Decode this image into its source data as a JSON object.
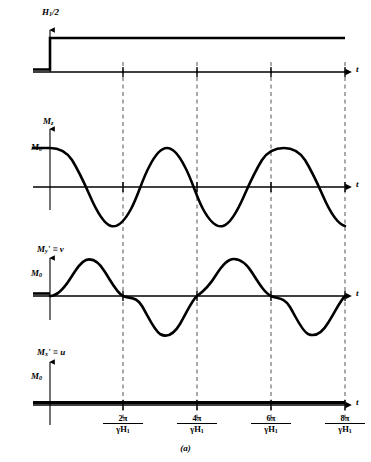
{
  "figure": {
    "caption": "(a)",
    "panels": [
      {
        "id": "h1-panel",
        "y_label_html": "H<sub>1</sub>/2",
        "y_label_text": "H1/2",
        "amplitude_label": "",
        "x_axis_label": "t",
        "curve": "step"
      },
      {
        "id": "mz-panel",
        "y_label_html": "M<sub>z</sub>",
        "y_label_text": "Mz",
        "amplitude_label": "M0",
        "amplitude_label_html": "M<sub>0</sub>",
        "x_axis_label": "t",
        "curve": "cosine"
      },
      {
        "id": "my-panel",
        "y_label_html": "M<sub>y</sub>' ≡ v",
        "y_label_text": "My' = v",
        "amplitude_label": "M0",
        "amplitude_label_html": "M<sub>0</sub>",
        "x_axis_label": "t",
        "curve": "sine"
      },
      {
        "id": "mx-panel",
        "y_label_html": "M<sub>x</sub>' ≡ u",
        "y_label_text": "Mx' = u",
        "amplitude_label": "M0",
        "amplitude_label_html": "M<sub>0</sub>",
        "x_axis_label": "t",
        "curve": "zero"
      }
    ],
    "x_ticks": [
      {
        "numerator": "2π",
        "denominator": "γH1",
        "denominator_html": "γH<sub>1</sub>"
      },
      {
        "numerator": "4π",
        "denominator": "γH1",
        "denominator_html": "γH<sub>1</sub>"
      },
      {
        "numerator": "6π",
        "denominator": "γH1",
        "denominator_html": "γH<sub>1</sub>"
      },
      {
        "numerator": "8π",
        "denominator": "γH1",
        "denominator_html": "γH<sub>1</sub>"
      }
    ],
    "colors": {
      "curve": "#000000",
      "axis": "#000000",
      "gridline": "#555555",
      "background": "#ffffff"
    }
  },
  "chart_data": {
    "type": "line",
    "title": "(a)",
    "xlabel": "t",
    "ylabel": "",
    "grid": true,
    "legend": "none",
    "x": [
      0,
      6.2832,
      12.5664,
      18.8496,
      25.1327
    ],
    "xtick_labels": [
      "2π/γH1",
      "4π/γH1",
      "6π/γH1",
      "8π/γH1"
    ],
    "xtick_values": [
      6.2832,
      12.5664,
      18.8496,
      25.1327
    ],
    "xlim": [
      -3.5,
      27.5
    ],
    "series": [
      {
        "name": "H1/2",
        "panel": 1,
        "kind": "step",
        "ylabel": "H1/2",
        "description": "Zero before t=0, constant positive value H1/2 after t=0",
        "values_before": 0,
        "values_after": 1,
        "ylim": [
          -0.35,
          1.25
        ]
      },
      {
        "name": "Mz",
        "panel": 2,
        "kind": "cosine",
        "ylabel": "Mz",
        "amplitude": 1,
        "amplitude_label": "M0",
        "description": "Mz = M0 cos(γH1 t); starts at M0, minimum -M0 at 2π/γH1, maximum at 4π/γH1",
        "period": 12.5664,
        "phase": 0,
        "ylim": [
          -1.25,
          1.25
        ],
        "key_points": [
          {
            "x": 0,
            "y": 1
          },
          {
            "x": 6.2832,
            "y": -1
          },
          {
            "x": 12.5664,
            "y": 1
          },
          {
            "x": 18.8496,
            "y": -1
          },
          {
            "x": 25.1327,
            "y": 1
          }
        ]
      },
      {
        "name": "My' = v",
        "panel": 3,
        "kind": "sine",
        "ylabel": "My' = v",
        "amplitude": 1,
        "amplitude_label": "M0",
        "description": "v = M0 sin(γH1 t); zero at t=0, maximum M0 at π/γH1, zero at 2π/γH1",
        "period": 12.5664,
        "phase": 0,
        "ylim": [
          -1.25,
          1.25
        ],
        "key_points": [
          {
            "x": 0,
            "y": 0
          },
          {
            "x": 3.1416,
            "y": 1
          },
          {
            "x": 6.2832,
            "y": 0
          },
          {
            "x": 9.4248,
            "y": -1
          },
          {
            "x": 12.5664,
            "y": 0
          },
          {
            "x": 15.708,
            "y": 1
          },
          {
            "x": 18.8496,
            "y": 0
          },
          {
            "x": 21.9911,
            "y": -1
          },
          {
            "x": 25.1327,
            "y": 0
          }
        ]
      },
      {
        "name": "Mx' = u",
        "panel": 4,
        "kind": "zero",
        "ylabel": "Mx' = u",
        "amplitude": 0,
        "amplitude_label": "M0",
        "description": "u remains identically zero for all t",
        "ylim": [
          -0.6,
          1.25
        ],
        "key_points": [
          {
            "x": 0,
            "y": 0
          },
          {
            "x": 25.1327,
            "y": 0
          }
        ]
      }
    ]
  }
}
